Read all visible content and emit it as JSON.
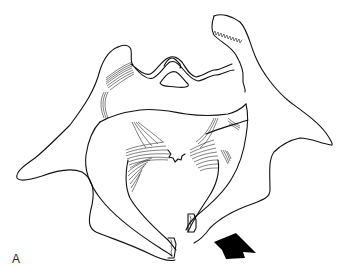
{
  "figure": {
    "panel_label": "A",
    "colors": {
      "line": "#111111",
      "background": "#ffffff",
      "arrow": "#000000"
    },
    "arrow": {
      "direction": "up-left",
      "position": {
        "x": 235,
        "y": 255
      }
    }
  }
}
